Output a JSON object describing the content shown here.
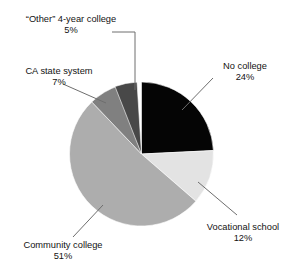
{
  "chart_data": {
    "type": "pie",
    "title": "",
    "xlabel": "",
    "ylabel": "",
    "legend_position": "none",
    "grid": false,
    "units": "percent",
    "total": 99,
    "categories": [
      "No college",
      "Vocational school",
      "Community college",
      "CA state system",
      "“Other” 4-year college"
    ],
    "values": [
      24,
      12,
      51,
      7,
      5
    ],
    "value_labels": [
      "24%",
      "12%",
      "51%",
      "7%",
      "5%"
    ],
    "colors": [
      "#050505",
      "#e3e3e3",
      "#adadad",
      "#808080",
      "#484848"
    ],
    "start_angle_deg": 0,
    "direction": "clockwise",
    "slices": [
      {
        "label": "No college",
        "value": 24,
        "value_label": "24%",
        "color": "#050505"
      },
      {
        "label": "Vocational school",
        "value": 12,
        "value_label": "12%",
        "color": "#e3e3e3"
      },
      {
        "label": "Community college",
        "value": 51,
        "value_label": "51%",
        "color": "#adadad"
      },
      {
        "label": "CA state system",
        "value": 7,
        "value_label": "7%",
        "color": "#808080"
      },
      {
        "label": "“Other” 4-year college",
        "value": 5,
        "value_label": "5%",
        "color": "#484848"
      }
    ]
  },
  "labels": {
    "other_four_year": {
      "name": "“Other” 4-year college",
      "pct": "5%"
    },
    "ca_state": {
      "name": "CA state system",
      "pct": "7%"
    },
    "no_college": {
      "name": "No college",
      "pct": "24%"
    },
    "vocational": {
      "name": "Vocational school",
      "pct": "12%"
    },
    "community": {
      "name": "Community college",
      "pct": "51%"
    }
  },
  "caption": {
    "text": ""
  }
}
